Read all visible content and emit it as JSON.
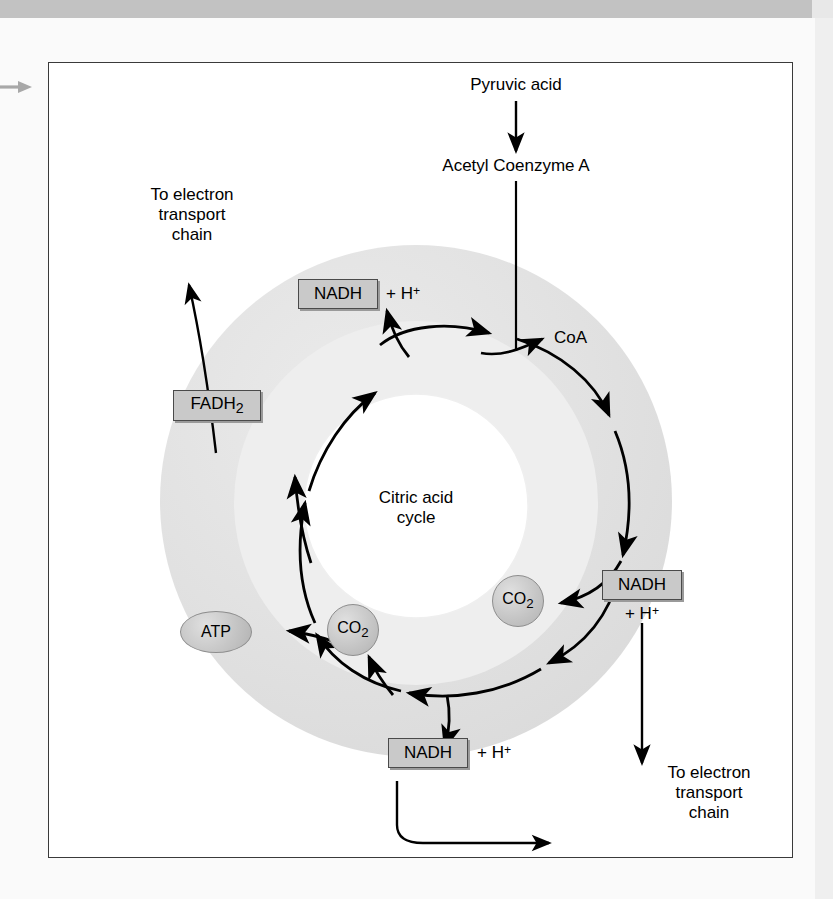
{
  "figure": {
    "frame_border_color": "#3a3a3a",
    "page_band_color": "#c2c2c2"
  },
  "diagram": {
    "center_label_line1": "Citric acid",
    "center_label_line2": "cycle",
    "inputs": {
      "pyruvic_acid": "Pyruvic acid",
      "acetyl_coenzyme_a": "Acetyl Coenzyme A"
    },
    "byproducts": {
      "coa": "CoA",
      "co2_left": "CO",
      "co2_left_sub": "2",
      "co2_right": "CO",
      "co2_right_sub": "2",
      "atp": "ATP"
    },
    "carriers": [
      {
        "id": "nadh-top",
        "box_label": "NADH",
        "suffix": "+ H",
        "suffix_sup": "+",
        "position": "top"
      },
      {
        "id": "fadh2",
        "box_label": "FADH",
        "box_label_sub": "2",
        "suffix": "",
        "position": "upper-left"
      },
      {
        "id": "nadh-right",
        "box_label": "NADH",
        "suffix": "+ H",
        "suffix_sup": "+",
        "position": "right"
      },
      {
        "id": "nadh-bottom",
        "box_label": "NADH",
        "suffix": "+ H",
        "suffix_sup": "+",
        "position": "bottom"
      }
    ],
    "destinations": {
      "left_line1": "To electron",
      "left_line2": "transport",
      "left_line3": "chain",
      "right_line1": "To electron",
      "right_line2": "transport",
      "right_line3": "chain"
    },
    "colors": {
      "outer_ring_fill": "#e4e4e4",
      "mid_ring_fill": "#ececec",
      "inner_disc_fill": "#ffffff",
      "box_fill": "#c9c9c9",
      "box_stroke": "#4a4a4a",
      "arrow_stroke": "#000000",
      "page_arrow": "#a8a8a8"
    }
  }
}
